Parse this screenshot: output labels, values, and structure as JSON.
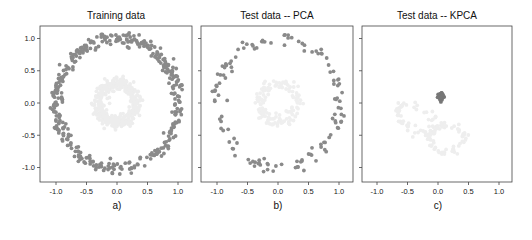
{
  "chart_data": [
    {
      "type": "scatter",
      "title": "Training data",
      "caption": "a)",
      "xlabel": "",
      "ylabel": "",
      "xlim": [
        -1.25,
        1.25
      ],
      "ylim": [
        -1.2,
        1.2
      ],
      "xticks": [
        "-1.0",
        "-0.5",
        "0.0",
        "0.5",
        "1.0"
      ],
      "yticks": [
        "1.0",
        "0.5",
        "0.0",
        "-0.5",
        "-1.0"
      ],
      "grid": false,
      "series": [
        {
          "name": "outer circle",
          "color": "#8a8a8a",
          "shape": "ring",
          "center": [
            0,
            0
          ],
          "radius": 1.0,
          "noise": 0.05,
          "n": 400
        },
        {
          "name": "inner circle",
          "color": "#ededed",
          "shape": "ring",
          "center": [
            0,
            0
          ],
          "radius": 0.3,
          "noise": 0.05,
          "n": 400
        }
      ]
    },
    {
      "type": "scatter",
      "title": "Test data -- PCA",
      "caption": "b)",
      "xlabel": "",
      "ylabel": "",
      "xlim": [
        -1.25,
        1.25
      ],
      "ylim": [
        -1.2,
        1.2
      ],
      "xticks": [
        "-1.0",
        "-0.5",
        "0.0",
        "0.5",
        "1.0"
      ],
      "yticks": [
        "1.0",
        "0.5",
        "0.0",
        "-0.5",
        "-1.0"
      ],
      "grid": false,
      "series": [
        {
          "name": "outer circle",
          "color": "#8a8a8a",
          "shape": "ring",
          "center": [
            0,
            0
          ],
          "radius": 1.0,
          "noise": 0.05,
          "n": 130
        },
        {
          "name": "inner circle",
          "color": "#efefef",
          "shape": "ring",
          "center": [
            0,
            0
          ],
          "radius": 0.3,
          "noise": 0.05,
          "n": 130
        }
      ]
    },
    {
      "type": "scatter",
      "title": "Test data -- KPCA",
      "caption": "c)",
      "xlabel": "",
      "ylabel": "",
      "xlim": [
        -1.25,
        1.25
      ],
      "ylim": [
        -1.2,
        1.2
      ],
      "xticks": [
        "-1.0",
        "-0.5",
        "0.0",
        "0.5",
        "1.0"
      ],
      "yticks": [
        "1.0",
        "0.5",
        "0.0",
        "-0.5",
        "-1.0"
      ],
      "grid": false,
      "series": [
        {
          "name": "outer circle (collapsed)",
          "color": "#777777",
          "shape": "cluster",
          "center": [
            0.05,
            0.1
          ],
          "spread": 0.02,
          "n": 60
        },
        {
          "name": "inner circle (projected)",
          "color": "#eeeeee",
          "shape": "loops",
          "loops": [
            {
              "center": [
                -0.35,
                -0.25
              ],
              "rx": 0.35,
              "ry": 0.18,
              "angle": -25
            },
            {
              "center": [
                0.15,
                -0.55
              ],
              "rx": 0.28,
              "ry": 0.22,
              "angle": 0
            }
          ],
          "noise": 0.03,
          "n": 130
        }
      ]
    }
  ],
  "panels_px": [
    {
      "left": 40,
      "right": 192,
      "top": 26,
      "bottom": 182,
      "x0": 117,
      "y0": 103,
      "sx": 61,
      "sy": 64.5
    },
    {
      "left": 201,
      "right": 353,
      "top": 26,
      "bottom": 182,
      "x0": 278,
      "y0": 103,
      "sx": 61,
      "sy": 64.5
    },
    {
      "left": 362,
      "right": 512,
      "top": 26,
      "bottom": 182,
      "x0": 438,
      "y0": 103,
      "sx": 61,
      "sy": 64.5
    }
  ]
}
